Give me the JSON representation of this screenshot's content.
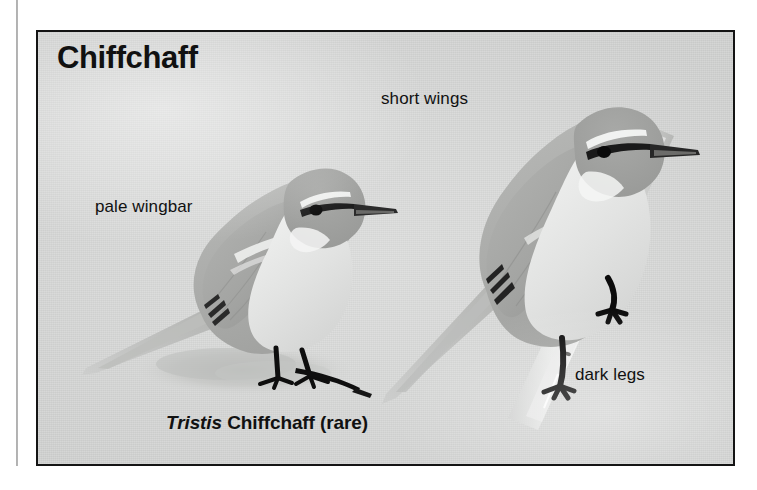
{
  "plate": {
    "title": "Chiffchaff",
    "caption": {
      "scientific": "Tristis",
      "rest": " Chiffchaff (rare)"
    },
    "background_color": "#d8d9d8",
    "border_color": "#141414",
    "text_color": "#111111",
    "callouts": [
      {
        "id": "pale-wingbar",
        "label": "pale wingbar"
      },
      {
        "id": "short-wings",
        "label": "short wings"
      },
      {
        "id": "dark-legs",
        "label": "dark legs"
      }
    ],
    "figures": [
      {
        "id": "bird-left",
        "name": "chiffchaff-standing-on-ground"
      },
      {
        "id": "bird-right",
        "name": "chiffchaff-perched-on-twig"
      }
    ]
  }
}
